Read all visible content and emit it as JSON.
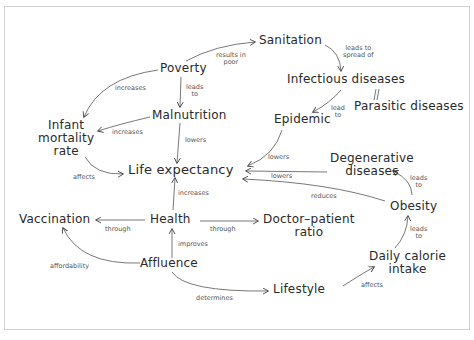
{
  "diagram": {
    "type": "concept-map",
    "nodes": {
      "poverty": "Poverty",
      "sanitation": "Sanitation",
      "infectious": "Infectious diseases",
      "parasitic": "Parasitic diseases",
      "malnutrition": "Malnutrition",
      "infant_1": "Infant",
      "infant_2": "mortality",
      "infant_3": "rate",
      "epidemic": "Epidemic",
      "life": "Life expectancy",
      "degenerative_1": "Degenerative",
      "degenerative_2": "diseases",
      "obesity": "Obesity",
      "vaccination": "Vaccination",
      "health": "Health",
      "doctor_1": "Doctor–patient",
      "doctor_2": "ratio",
      "affluence": "Affluence",
      "lifestyle": "Lifestyle",
      "calorie_1": "Daily calorie",
      "calorie_2": "intake"
    },
    "edge_labels": {
      "poverty_sanitation_1": "results in",
      "poverty_sanitation_2": "poor",
      "sanitation_infectious_1": "leads to",
      "sanitation_infectious_2": "spread of",
      "poverty_infant": "increases",
      "poverty_malnutrition_1": "leads",
      "poverty_malnutrition_2": "to",
      "malnutrition_infant": "increases",
      "malnutrition_life": "lowers",
      "infectious_epidemic_1": "lead",
      "infectious_epidemic_2": "to",
      "epidemic_life": "lowers",
      "degenerative_life": "lowers",
      "obesity_life": "reduces",
      "obesity_degenerative_1": "leads",
      "obesity_degenerative_2": "to",
      "infant_life": "affects",
      "health_life": "increases",
      "health_vaccination": "through",
      "health_doctor": "through",
      "affluence_health": "improves",
      "affluence_vaccination": "affordability",
      "affluence_lifestyle": "determines",
      "lifestyle_calorie": "affects",
      "calorie_obesity_1": "leads",
      "calorie_obesity_2": "to"
    },
    "edges": [
      {
        "from": "Poverty",
        "to": "Sanitation",
        "label": "results in poor"
      },
      {
        "from": "Sanitation",
        "to": "Infectious diseases",
        "label": "leads to spread of"
      },
      {
        "from": "Poverty",
        "to": "Infant mortality rate",
        "label": "increases"
      },
      {
        "from": "Poverty",
        "to": "Malnutrition",
        "label": "leads to"
      },
      {
        "from": "Malnutrition",
        "to": "Infant mortality rate",
        "label": "increases"
      },
      {
        "from": "Malnutrition",
        "to": "Life expectancy",
        "label": "lowers"
      },
      {
        "from": "Parasitic diseases",
        "to": "Infectious diseases",
        "label": ""
      },
      {
        "from": "Infectious diseases",
        "to": "Epidemic",
        "label": "lead to"
      },
      {
        "from": "Epidemic",
        "to": "Life expectancy",
        "label": "lowers"
      },
      {
        "from": "Degenerative diseases",
        "to": "Life expectancy",
        "label": "lowers"
      },
      {
        "from": "Obesity",
        "to": "Life expectancy",
        "label": "reduces"
      },
      {
        "from": "Obesity",
        "to": "Degenerative diseases",
        "label": "leads to"
      },
      {
        "from": "Infant mortality rate",
        "to": "Life expectancy",
        "label": "affects"
      },
      {
        "from": "Health",
        "to": "Life expectancy",
        "label": "increases"
      },
      {
        "from": "Health",
        "to": "Vaccination",
        "label": "through"
      },
      {
        "from": "Health",
        "to": "Doctor–patient ratio",
        "label": "through"
      },
      {
        "from": "Affluence",
        "to": "Health",
        "label": "improves"
      },
      {
        "from": "Affluence",
        "to": "Vaccination",
        "label": "affordability"
      },
      {
        "from": "Affluence",
        "to": "Lifestyle",
        "label": "determines"
      },
      {
        "from": "Lifestyle",
        "to": "Daily calorie intake",
        "label": "affects"
      },
      {
        "from": "Daily calorie intake",
        "to": "Obesity",
        "label": "leads to"
      }
    ]
  }
}
